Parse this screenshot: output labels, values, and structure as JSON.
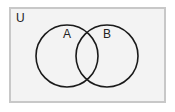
{
  "diagram": {
    "type": "venn",
    "universe_label": "U",
    "sets": [
      {
        "label": "A",
        "cx": 67,
        "cy": 56,
        "r": 31
      },
      {
        "label": "B",
        "cx": 107,
        "cy": 56,
        "r": 31
      }
    ],
    "colors": {
      "background": "#ffffff",
      "universe_fill": "#f3f3f3",
      "universe_border": "#c8c8c8",
      "circle_stroke": "#1a1a1a"
    }
  }
}
